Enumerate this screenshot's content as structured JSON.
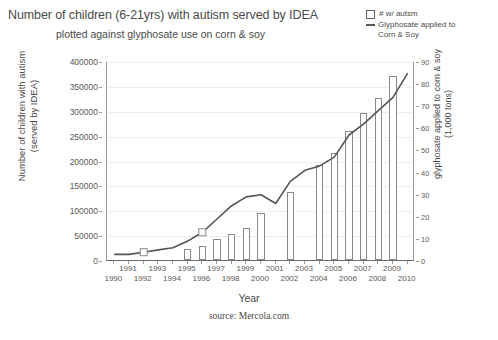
{
  "title": {
    "main": "Number of children (6-21yrs) with autism served by IDEA",
    "sub": "plotted against glyphosate use on corn & soy"
  },
  "legend": {
    "position": "top-right",
    "items": [
      {
        "label": "# w/ autsm",
        "marker": "open-square",
        "color": "#666666"
      },
      {
        "label": "Glyphosate applied to\nCorn & Soy",
        "marker": "line",
        "color": "#555555"
      }
    ]
  },
  "source": "source: Mercola.com",
  "xaxis": {
    "title": "Year"
  },
  "yaxis_left": {
    "title": "Number of children with autism\n(served by IDEA)"
  },
  "yaxis_right": {
    "title": "glyphosate applied to corn & soy\n(1,000 tons)"
  },
  "chart_data": {
    "type": "bar",
    "title": "Number of children (6-21yrs) with autism served by IDEA plotted against glyphosate use on corn & soy",
    "xlabel": "Year",
    "ylabel": "Number of children with autism (served by IDEA)",
    "y2label": "glyphosate applied to corn & soy (1,000 tons)",
    "ylim": [
      0,
      400000
    ],
    "y2lim": [
      0,
      90
    ],
    "yticks": [
      0,
      50000,
      100000,
      150000,
      200000,
      250000,
      300000,
      350000,
      400000
    ],
    "y2ticks": [
      0,
      10,
      20,
      30,
      40,
      50,
      60,
      70,
      80,
      90
    ],
    "grid": true,
    "categories": [
      1990,
      1991,
      1992,
      1993,
      1994,
      1995,
      1996,
      1997,
      1998,
      1999,
      2000,
      2001,
      2002,
      2003,
      2004,
      2005,
      2006,
      2007,
      2008,
      2009,
      2010
    ],
    "xtick_labels_upper": [
      "1991",
      "1993",
      "1995",
      "1997",
      "1999",
      "2001",
      "2003",
      "2005",
      "2007",
      "2009"
    ],
    "xtick_labels_lower": [
      "1990",
      "1992",
      "1994",
      "1996",
      "1998",
      "2000",
      "2002",
      "2004",
      "2006",
      "2008",
      "2010"
    ],
    "series": [
      {
        "name": "# w/ autsm",
        "type": "bar",
        "axis": "left",
        "units": "children",
        "x": [
          1990,
          1991,
          1992,
          1993,
          1994,
          1995,
          1996,
          1997,
          1998,
          1999,
          2000,
          2001,
          2002,
          2003,
          2004,
          2005,
          2006,
          2007,
          2008,
          2009,
          2010
        ],
        "values": [
          null,
          null,
          null,
          null,
          null,
          22000,
          28000,
          42000,
          53000,
          65000,
          94000,
          null,
          137000,
          null,
          190000,
          215000,
          260000,
          295000,
          325000,
          370000,
          null
        ]
      },
      {
        "name": "Glyphosate applied to Corn & Soy",
        "type": "line",
        "axis": "right",
        "units": "1,000 tons",
        "x": [
          1990,
          1991,
          1992,
          1993,
          1994,
          1995,
          1996,
          1997,
          1998,
          1999,
          2000,
          2001,
          2002,
          2003,
          2004,
          2005,
          2006,
          2007,
          2008,
          2009,
          2010
        ],
        "values": [
          3,
          3,
          4,
          5,
          6,
          9,
          13,
          19,
          25,
          29,
          30,
          26,
          36,
          41,
          43,
          47,
          57,
          62,
          68,
          74,
          85
        ],
        "markers": [
          {
            "x": 1992,
            "marker": "open-square"
          },
          {
            "x": 1996,
            "marker": "open-square"
          }
        ]
      }
    ]
  },
  "colors": {
    "bar_stroke": "#8a8a8a",
    "bar_fill": "#ffffff",
    "line": "#555555",
    "grid": "#ededed",
    "axis": "#9a9a9a",
    "text": "#4a4a4a"
  }
}
